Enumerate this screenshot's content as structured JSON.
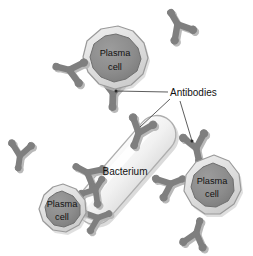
{
  "figure": {
    "background_color": "#ffffff",
    "width": 253,
    "height": 256
  },
  "palette": {
    "membrane_fill": "#d9d9d9",
    "membrane_stroke": "#9a9a9a",
    "membrane_highlight": "#efefef",
    "nucleus_fill": "#8c8c8c",
    "nucleus_stroke": "#6f6f6f",
    "bacterium_fill": "#f1f1f1",
    "bacterium_stroke": "#a8a8a8",
    "bacterium_shadow": "#cfcfcf",
    "antibody_fill": "#7f7f7f",
    "antibody_shadow": "#b9b9b9",
    "leader_line": "#333333",
    "text_color": "#111111"
  },
  "labels": {
    "antibodies": "Antibodies",
    "bacterium": "Bacterium",
    "plasma_cell_line1": "Plasma",
    "plasma_cell_line2": "cell"
  },
  "cells": [
    {
      "id": "plasma-cell-top",
      "name": "Plasma cell",
      "label_line1": "Plasma",
      "label_line2": "cell",
      "center_x": 115,
      "center_y": 57,
      "radius": 33
    },
    {
      "id": "plasma-cell-right",
      "name": "Plasma cell",
      "label_line1": "Plasma",
      "label_line2": "cell",
      "center_x": 212,
      "center_y": 185,
      "radius": 31
    },
    {
      "id": "plasma-cell-bottom-left",
      "name": "Plasma cell",
      "label_line1": "Plasma",
      "label_line2": "cell",
      "center_x": 62,
      "center_y": 208,
      "radius": 25
    }
  ],
  "bacterium": {
    "id": "bacterium",
    "name": "Bacterium",
    "label": "Bacterium",
    "label_x": 125,
    "label_y": 172,
    "angle_deg": -49
  },
  "callout": {
    "text": "Antibodies",
    "text_x": 172,
    "text_y": 96,
    "targets": [
      {
        "id": "callout-target-top-cell",
        "x": 116,
        "y": 91
      },
      {
        "id": "callout-target-bacterium",
        "x": 140,
        "y": 127
      },
      {
        "id": "callout-target-right-cell",
        "x": 192,
        "y": 140
      }
    ]
  },
  "antibodies": [
    {
      "id": "antibody-free-top-right",
      "x": 178,
      "y": 25,
      "angle": 150,
      "scale": 1.0,
      "attached": false
    },
    {
      "id": "antibody-free-upper-left",
      "x": 70,
      "y": 70,
      "angle": 104,
      "scale": 1.0,
      "attached": false
    },
    {
      "id": "antibody-free-left",
      "x": 20,
      "y": 155,
      "angle": 8,
      "scale": 0.92,
      "attached": false
    },
    {
      "id": "antibody-free-bottom-right",
      "x": 196,
      "y": 234,
      "angle": 196,
      "scale": 0.95,
      "attached": false
    },
    {
      "id": "antibody-bound-top-cell",
      "x": 113,
      "y": 92,
      "angle": 2,
      "scale": 1.05,
      "attached": true
    },
    {
      "id": "antibody-bound-bacterium-top",
      "x": 139,
      "y": 132,
      "angle": 20,
      "scale": 1.0,
      "attached": true
    },
    {
      "id": "antibody-bound-bacterium-left",
      "x": 88,
      "y": 173,
      "angle": 118,
      "scale": 0.95,
      "attached": true
    },
    {
      "id": "antibody-bound-bacterium-right",
      "x": 170,
      "y": 184,
      "angle": 248,
      "scale": 0.95,
      "attached": true
    },
    {
      "id": "antibody-bound-right-cell",
      "x": 196,
      "y": 147,
      "angle": 348,
      "scale": 1.0,
      "attached": true
    },
    {
      "id": "antibody-bound-bottom-left-cell-a",
      "x": 95,
      "y": 190,
      "angle": 212,
      "scale": 0.9,
      "attached": true
    },
    {
      "id": "antibody-bound-bottom-left-cell-b",
      "x": 97,
      "y": 218,
      "angle": 250,
      "scale": 0.9,
      "attached": true
    }
  ]
}
